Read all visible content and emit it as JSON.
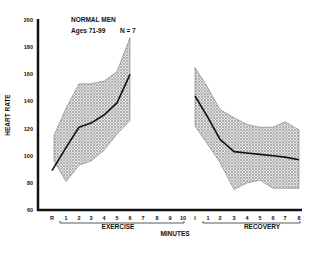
{
  "chart_data": {
    "type": "area",
    "title": "NORMAL MEN",
    "subtitle": "Ages 71-99",
    "annotation": "N = 7",
    "ylabel": "HEART RATE",
    "xlabel": "MINUTES",
    "ylim": [
      60,
      200
    ],
    "yticks": [
      60,
      80,
      100,
      120,
      140,
      160,
      180,
      200
    ],
    "grid": false,
    "legend": null,
    "groups": [
      {
        "label": "EXERCISE",
        "ticks": [
          "R",
          "1",
          "2",
          "3",
          "4",
          "5",
          "6",
          "7",
          "8",
          "9",
          "10"
        ]
      },
      {
        "label": "RECOVERY",
        "ticks": [
          "I",
          "1",
          "2",
          "3",
          "4",
          "5",
          "6",
          "7",
          "8"
        ]
      }
    ],
    "series": [
      {
        "name": "Exercise mean",
        "x": [
          "R",
          "1",
          "2",
          "3",
          "4",
          "5",
          "6"
        ],
        "values": [
          89,
          106,
          121,
          124,
          130,
          139,
          160
        ]
      },
      {
        "name": "Exercise range upper",
        "x": [
          "R",
          "1",
          "2",
          "3",
          "4",
          "5",
          "6"
        ],
        "values": [
          115,
          135,
          153,
          153,
          155,
          162,
          187
        ]
      },
      {
        "name": "Exercise range lower",
        "x": [
          "R",
          "1",
          "2",
          "3",
          "4",
          "5",
          "6"
        ],
        "values": [
          96,
          81,
          93,
          96,
          104,
          116,
          126
        ]
      },
      {
        "name": "Recovery mean",
        "x": [
          "I",
          "1",
          "2",
          "3",
          "4",
          "5",
          "6",
          "7",
          "8"
        ],
        "values": [
          144,
          128,
          112,
          103,
          102,
          101,
          100,
          99,
          97
        ]
      },
      {
        "name": "Recovery range upper",
        "x": [
          "I",
          "1",
          "2",
          "3",
          "4",
          "5",
          "6",
          "7",
          "8"
        ],
        "values": [
          165,
          150,
          134,
          128,
          123,
          121,
          121,
          125,
          119
        ]
      },
      {
        "name": "Recovery range lower",
        "x": [
          "I",
          "1",
          "2",
          "3",
          "4",
          "5",
          "6",
          "7",
          "8"
        ],
        "values": [
          122,
          108,
          95,
          75,
          80,
          82,
          76,
          76,
          76
        ]
      }
    ]
  },
  "colors": {
    "ink": "#111111",
    "band": "#b8b8b8",
    "background": "#ffffff"
  }
}
